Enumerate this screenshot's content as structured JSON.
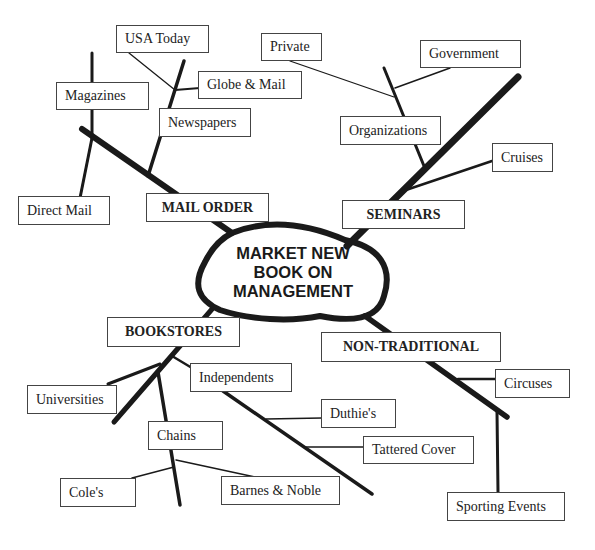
{
  "diagram": {
    "type": "mind-map",
    "center": {
      "line1": "MARKET NEW",
      "line2": "BOOK ON",
      "line3": "MANAGEMENT"
    },
    "branches": {
      "mail_order": {
        "label": "MAIL ORDER",
        "children": {
          "magazines": "Magazines",
          "direct_mail": "Direct Mail",
          "newspapers": {
            "label": "Newspapers",
            "children": {
              "usa_today": "USA Today",
              "globe_mail": "Globe & Mail"
            }
          }
        }
      },
      "seminars": {
        "label": "SEMINARS",
        "children": {
          "organizations": {
            "label": "Organizations",
            "children": {
              "private": "Private",
              "government": "Government"
            }
          },
          "cruises": "Cruises"
        }
      },
      "bookstores": {
        "label": "BOOKSTORES",
        "children": {
          "universities": "Universities",
          "independents": {
            "label": "Independents",
            "children": {
              "duthies": "Duthie's",
              "tattered_cover": "Tattered Cover"
            }
          },
          "chains": {
            "label": "Chains",
            "children": {
              "coles": "Cole's",
              "barnes_noble": "Barnes & Noble"
            }
          }
        }
      },
      "non_traditional": {
        "label": "NON-TRADITIONAL",
        "children": {
          "circuses": "Circuses",
          "sporting_events": "Sporting Events"
        }
      }
    },
    "colors": {
      "line": "#1a1a1a",
      "box_border": "#444444",
      "text": "#222222"
    }
  }
}
